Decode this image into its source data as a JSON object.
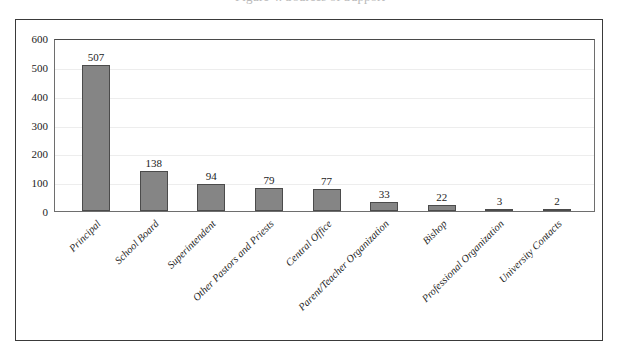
{
  "figure": {
    "title_sliver": "Figure 4. Sources of Support",
    "border_color": "#3a3a3a"
  },
  "chart_data": {
    "type": "bar",
    "title": "",
    "xlabel": "",
    "ylabel": "",
    "ylim": [
      0,
      600
    ],
    "ytick_step": 100,
    "grid": true,
    "legend": "none",
    "bar_color": "#858585",
    "bar_border_color": "#4b4b4b",
    "yticks": [
      "600",
      "500",
      "400",
      "300",
      "200",
      "100",
      "0"
    ],
    "categories": [
      "Principal",
      "School Board",
      "Superintendent",
      "Other Pastors and Priests",
      "Central Office",
      "Parent/Teacher Organization",
      "Bishop",
      "Professional Organization",
      "University Contacts"
    ],
    "values": [
      507,
      138,
      94,
      79,
      77,
      33,
      22,
      3,
      2
    ],
    "value_labels": [
      "507",
      "138",
      "94",
      "79",
      "77",
      "33",
      "22",
      "3",
      "2"
    ]
  }
}
